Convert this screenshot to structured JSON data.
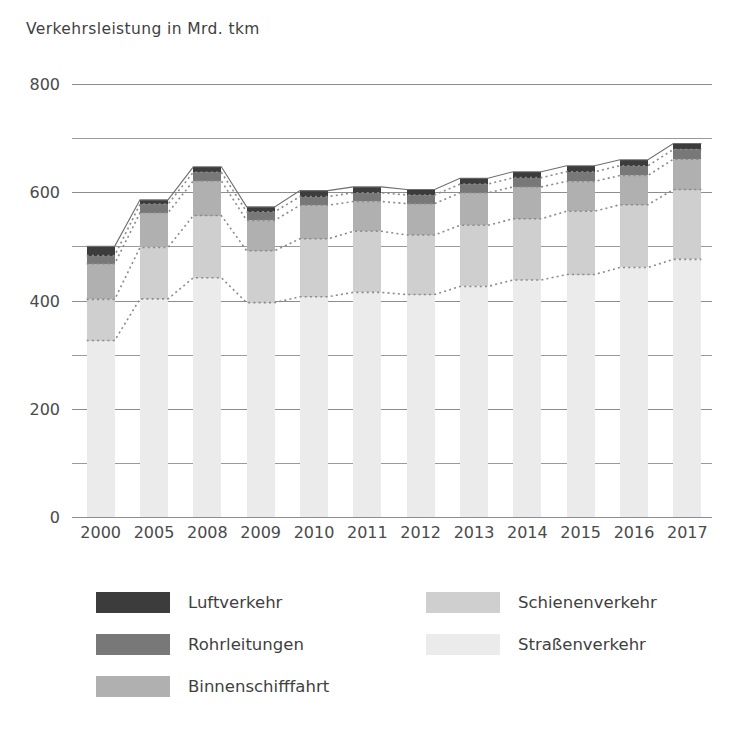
{
  "chart_data": {
    "type": "bar",
    "title": "Verkehrsleistung in Mrd. tkm",
    "subtitle": "",
    "xlabel": "",
    "ylabel": "Verkehrsleistung in Mrd. tkm",
    "stacked": true,
    "grid": true,
    "legend_position": "bottom",
    "ylim": [
      0,
      800
    ],
    "yticks": [
      0,
      200,
      400,
      600,
      800
    ],
    "ytick_labels": [
      "0",
      "200",
      "400",
      "600",
      "800"
    ],
    "yminor_ticks": [
      100,
      300,
      500,
      700
    ],
    "categories": [
      "2000",
      "2005",
      "2008",
      "2009",
      "2010",
      "2011",
      "2012",
      "2013",
      "2014",
      "2015",
      "2016",
      "2017"
    ],
    "series": [
      {
        "name": "Straßenverkehr",
        "color": "#ebebeb",
        "values": [
          326,
          403,
          442,
          396,
          407,
          415,
          411,
          426,
          438,
          448,
          461,
          476
        ]
      },
      {
        "name": "Schienenverkehr",
        "color": "#cfcfcf",
        "values": [
          76,
          95,
          115,
          96,
          107,
          113,
          110,
          113,
          113,
          117,
          116,
          129
        ]
      },
      {
        "name": "Binnenschifffahrt",
        "color": "#b0b0b0",
        "values": [
          66,
          64,
          64,
          56,
          62,
          55,
          58,
          60,
          59,
          55,
          54,
          56
        ]
      },
      {
        "name": "Rohrleitungen",
        "color": "#787878",
        "values": [
          15,
          16,
          16,
          16,
          16,
          16,
          16,
          16,
          17,
          18,
          18,
          18
        ]
      },
      {
        "name": "Luftverkehr",
        "color": "#3c3c3c",
        "values": [
          17,
          8,
          10,
          9,
          11,
          11,
          10,
          11,
          11,
          11,
          11,
          11
        ]
      }
    ],
    "totals": [
      500,
      586,
      647,
      573,
      603,
      610,
      605,
      626,
      638,
      649,
      660,
      690
    ],
    "connector_note": "dotted lines connect equivalent stack boundaries between adjacent bars"
  },
  "legend": {
    "items": [
      {
        "label": "Luftverkehr",
        "color": "#3c3c3c",
        "column": 0,
        "row": 0
      },
      {
        "label": "Rohrleitungen",
        "color": "#787878",
        "column": 0,
        "row": 1
      },
      {
        "label": "Binnenschifffahrt",
        "color": "#b0b0b0",
        "column": 0,
        "row": 2
      },
      {
        "label": "Schienenverkehr",
        "color": "#cfcfcf",
        "column": 1,
        "row": 0
      },
      {
        "label": "Straßenverkehr",
        "color": "#ebebeb",
        "column": 1,
        "row": 1
      }
    ]
  }
}
